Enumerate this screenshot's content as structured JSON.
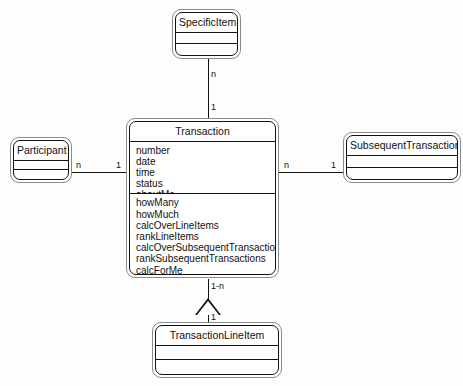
{
  "diagram": {
    "type": "uml-class-diagram",
    "background_color": "#fdfdfd",
    "line_color": "#111111"
  },
  "classes": {
    "specific_item": {
      "name": "SpecificItem",
      "attributes": [],
      "operations": []
    },
    "participant": {
      "name": "Participant",
      "attributes": [],
      "operations": []
    },
    "transaction": {
      "name": "Transaction",
      "attributes": [
        "number",
        "date",
        "time",
        "status",
        "aboutMe"
      ],
      "operations": [
        "howMany",
        "howMuch",
        "calcOverLineItems",
        "rankLineItems",
        "calcOverSubsequentTransactions",
        "rankSubsequentTransactions",
        "calcForMe",
        "rateMe"
      ]
    },
    "subsequent_transaction": {
      "name": "SubsequentTransaction",
      "attributes": [],
      "operations": []
    },
    "transaction_line_item": {
      "name": "TransactionLineItem",
      "attributes": [],
      "operations": []
    }
  },
  "associations": {
    "specific_item_to_transaction": {
      "near_specific_item": "n",
      "near_transaction": "1"
    },
    "participant_to_transaction": {
      "near_participant": "n",
      "near_transaction": "1"
    },
    "transaction_to_subsequent": {
      "near_transaction": "n",
      "near_subsequent": "1"
    },
    "transaction_to_line_item": {
      "near_transaction": "1-n",
      "near_line_item": "1"
    }
  }
}
